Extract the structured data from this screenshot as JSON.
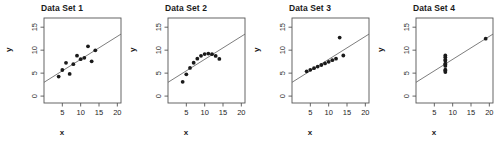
{
  "figure": {
    "panel_width": 124,
    "panel_height": 141,
    "background": "#ffffff",
    "point_color": "#1a1a1a",
    "line_color": "#666666",
    "frame_color": "#555555"
  },
  "axes": {
    "xlabel": "x",
    "ylabel": "y",
    "xlim": [
      0,
      21
    ],
    "ylim": [
      -1.5,
      17
    ],
    "xticks": [
      5,
      10,
      15,
      20
    ],
    "yticks": [
      0,
      5,
      10,
      15
    ],
    "grid": false
  },
  "chart_data": [
    {
      "type": "scatter",
      "title": "Data Set 1",
      "xlabel": "x",
      "ylabel": "y",
      "xlim": [
        0,
        21
      ],
      "ylim": [
        -1.5,
        17
      ],
      "xticks": [
        5,
        10,
        15,
        20
      ],
      "yticks": [
        0,
        5,
        10,
        15
      ],
      "grid": false,
      "x": [
        10,
        8,
        13,
        9,
        11,
        14,
        6,
        4,
        12,
        7,
        5
      ],
      "y": [
        8.04,
        6.95,
        7.58,
        8.81,
        8.33,
        9.96,
        7.24,
        4.26,
        10.84,
        4.82,
        5.68
      ],
      "fit_line": {
        "intercept": 3.0,
        "slope": 0.5,
        "label": "y = 3.00 + 0.50x"
      }
    },
    {
      "type": "scatter",
      "title": "Data Set 2",
      "xlabel": "x",
      "ylabel": "y",
      "xlim": [
        0,
        21
      ],
      "ylim": [
        -1.5,
        17
      ],
      "xticks": [
        5,
        10,
        15,
        20
      ],
      "yticks": [
        0,
        5,
        10,
        15
      ],
      "grid": false,
      "x": [
        10,
        8,
        13,
        9,
        11,
        14,
        6,
        4,
        12,
        7,
        5
      ],
      "y": [
        9.14,
        8.14,
        8.74,
        8.77,
        9.26,
        8.1,
        6.13,
        3.1,
        9.13,
        7.26,
        4.74
      ],
      "fit_line": {
        "intercept": 3.0,
        "slope": 0.5,
        "label": "y = 3.00 + 0.50x"
      }
    },
    {
      "type": "scatter",
      "title": "Data Set 3",
      "xlabel": "x",
      "ylabel": "y",
      "xlim": [
        0,
        21
      ],
      "ylim": [
        -1.5,
        17
      ],
      "xticks": [
        5,
        10,
        15,
        20
      ],
      "yticks": [
        0,
        5,
        10,
        15
      ],
      "grid": false,
      "x": [
        10,
        8,
        13,
        9,
        11,
        14,
        6,
        4,
        12,
        7,
        5
      ],
      "y": [
        7.46,
        6.77,
        12.74,
        7.11,
        7.81,
        8.84,
        6.08,
        5.39,
        8.15,
        6.42,
        5.73
      ],
      "fit_line": {
        "intercept": 3.0,
        "slope": 0.5,
        "label": "y = 3.00 + 0.50x"
      }
    },
    {
      "type": "scatter",
      "title": "Data Set 4",
      "xlabel": "x",
      "ylabel": "y",
      "xlim": [
        0,
        21
      ],
      "ylim": [
        -1.5,
        17
      ],
      "xticks": [
        5,
        10,
        15,
        20
      ],
      "yticks": [
        0,
        5,
        10,
        15
      ],
      "grid": false,
      "x": [
        8,
        8,
        8,
        8,
        8,
        8,
        8,
        19,
        8,
        8,
        8
      ],
      "y": [
        6.58,
        5.76,
        7.71,
        8.84,
        8.47,
        7.04,
        5.25,
        12.5,
        5.56,
        7.91,
        6.89
      ],
      "fit_line": {
        "intercept": 3.0,
        "slope": 0.5,
        "label": "y = 3.00 + 0.50x"
      }
    }
  ]
}
